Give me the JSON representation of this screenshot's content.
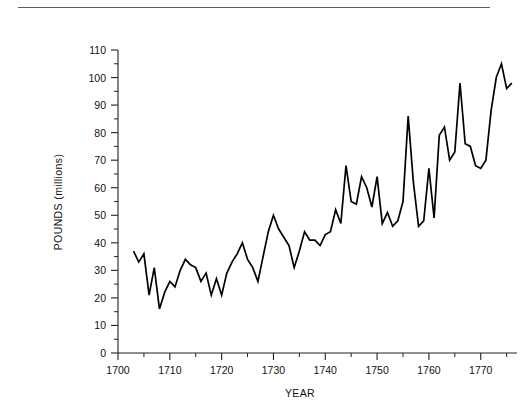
{
  "figure": {
    "background_color": "#ffffff",
    "line_color": "#000000",
    "axis_color": "#222222",
    "rule_color": "#5d5d5d"
  },
  "chart_data": {
    "type": "line",
    "title": "",
    "subtitle": "",
    "xlabel": "YEAR",
    "ylabel": "POUNDS (millions)",
    "xlim": [
      1700,
      1777
    ],
    "ylim": [
      0,
      110
    ],
    "grid": false,
    "legend": null,
    "legend_position": "none",
    "x_major_ticks": [
      1700,
      1710,
      1720,
      1730,
      1740,
      1750,
      1760,
      1770
    ],
    "x_major_tick_labels": [
      "1700",
      "1710",
      "1720",
      "1730",
      "1740",
      "1750",
      "1760",
      "1770"
    ],
    "x_minor_tick_interval": 5,
    "y_major_ticks": [
      0,
      10,
      20,
      30,
      40,
      50,
      60,
      70,
      80,
      90,
      100,
      110
    ],
    "y_major_tick_labels": [
      "0",
      "10",
      "20",
      "30",
      "40",
      "50",
      "60",
      "70",
      "80",
      "90",
      "100",
      "110"
    ],
    "y_minor_tick_interval": 5,
    "series": [
      {
        "name": "Pounds (millions)",
        "x": [
          1703,
          1704,
          1705,
          1706,
          1707,
          1708,
          1709,
          1710,
          1711,
          1712,
          1713,
          1714,
          1715,
          1716,
          1717,
          1718,
          1719,
          1720,
          1721,
          1722,
          1723,
          1724,
          1725,
          1726,
          1727,
          1728,
          1729,
          1730,
          1731,
          1732,
          1733,
          1734,
          1735,
          1736,
          1737,
          1738,
          1739,
          1740,
          1741,
          1742,
          1743,
          1744,
          1745,
          1746,
          1747,
          1748,
          1749,
          1750,
          1751,
          1752,
          1753,
          1754,
          1755,
          1756,
          1757,
          1758,
          1759,
          1760,
          1761,
          1762,
          1763,
          1764,
          1765,
          1766,
          1767,
          1768,
          1769,
          1770,
          1771,
          1772,
          1773,
          1774,
          1775,
          1776
        ],
        "y": [
          37,
          33,
          36,
          21,
          31,
          16,
          22,
          26,
          24,
          30,
          34,
          32,
          31,
          26,
          29,
          21,
          27,
          21,
          29,
          33,
          36,
          40,
          34,
          31,
          26,
          35,
          44,
          50,
          45,
          42,
          39,
          31,
          37,
          44,
          41,
          41,
          39,
          43,
          44,
          52,
          47,
          68,
          55,
          54,
          64,
          60,
          53,
          64,
          47,
          51,
          46,
          48,
          55,
          86,
          62,
          46,
          48,
          67,
          49,
          79,
          82,
          70,
          73,
          98,
          76,
          75,
          68,
          67,
          70,
          88,
          100,
          105,
          96,
          98
        ]
      }
    ]
  }
}
